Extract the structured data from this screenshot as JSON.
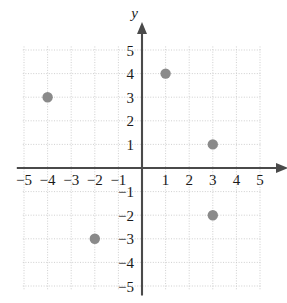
{
  "chart_data": {
    "type": "scatter",
    "title": "",
    "xlabel": "x",
    "ylabel": "y",
    "xlim": [
      -5,
      5
    ],
    "ylim": [
      -5,
      5
    ],
    "grid": true,
    "legend": false,
    "x_ticks": [
      -5,
      -4,
      -3,
      -2,
      -1,
      1,
      2,
      3,
      4,
      5
    ],
    "y_ticks": [
      -5,
      -4,
      -3,
      -2,
      -1,
      1,
      2,
      3,
      4,
      5
    ],
    "x_tick_labels": [
      "−5",
      "−4",
      "−3",
      "−2",
      "−1",
      "1",
      "2",
      "3",
      "4",
      "5"
    ],
    "y_tick_labels": [
      "−5",
      "−4",
      "−3",
      "−2",
      "−1",
      "1",
      "2",
      "3",
      "4",
      "5"
    ],
    "point_color": "#8a8a8a",
    "axis_color": "#4a4a4a",
    "grid_color": "#c9c9c9",
    "points": [
      {
        "x": -4,
        "y": 3,
        "label": "(−4, 3)"
      },
      {
        "x": 1,
        "y": 4,
        "label": "(1, 4)"
      },
      {
        "x": 3,
        "y": 1,
        "label": "(3, 1)"
      },
      {
        "x": 3,
        "y": -2,
        "label": "(3, −2)"
      },
      {
        "x": -2,
        "y": -3,
        "label": "(−2, −3)"
      }
    ]
  }
}
